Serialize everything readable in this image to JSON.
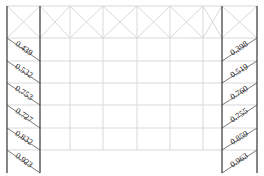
{
  "diagram": {
    "type": "structural-frame-elevation",
    "colors": {
      "grid_line": "#d9d9d9",
      "column_line": "#444444",
      "brace_line": "#555555",
      "label_text": "#222222",
      "background": "#ffffff"
    },
    "columns_x": [
      7,
      40,
      70,
      103,
      137,
      170,
      203,
      222,
      257
    ],
    "top_y": 6,
    "header_bottom_y": 38,
    "row_y": [
      38,
      61,
      83,
      105,
      128,
      150,
      173
    ],
    "left_braces": [
      {
        "value": "0.439"
      },
      {
        "value": "0.532"
      },
      {
        "value": "0.753"
      },
      {
        "value": "0.727"
      },
      {
        "value": "0.832"
      },
      {
        "value": "0.923"
      }
    ],
    "right_braces": [
      {
        "value": "0.398"
      },
      {
        "value": "0.519"
      },
      {
        "value": "0.760"
      },
      {
        "value": "0.755"
      },
      {
        "value": "0.859"
      },
      {
        "value": "0.963"
      }
    ]
  }
}
